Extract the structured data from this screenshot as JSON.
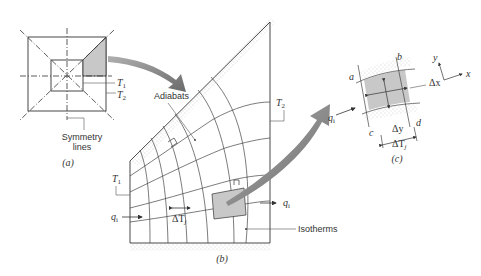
{
  "panel_a": {
    "label": "(a)",
    "T1": "T",
    "T1_sub": "1",
    "T2": "T",
    "T2_sub": "2",
    "symmetry_line1": "Symmetry",
    "symmetry_line2": "lines"
  },
  "panel_b": {
    "label": "(b)",
    "adiabats": "Adiabats",
    "isotherms": "Isotherms",
    "T1": "T",
    "T1_sub": "1",
    "T2": "T",
    "T2_sub": "2",
    "q_in": "q",
    "q_in_sub": "i",
    "q_out": "q",
    "q_out_sub": "i",
    "delta_T": "ΔT",
    "delta_T_sub": "j"
  },
  "panel_c": {
    "label": "(c)",
    "corner_a": "a",
    "corner_b": "b",
    "corner_c": "c",
    "corner_d": "d",
    "delta_x": "Δx",
    "delta_y": "Δy",
    "delta_T": "ΔT",
    "delta_T_sub": "j",
    "q": "q",
    "q_sub": "i",
    "axis_x": "x",
    "axis_y": "y"
  },
  "colors": {
    "line": "#333333",
    "shade": "#c8c8c8",
    "arrow": "#7a7a7a",
    "stipple": "#999999"
  }
}
